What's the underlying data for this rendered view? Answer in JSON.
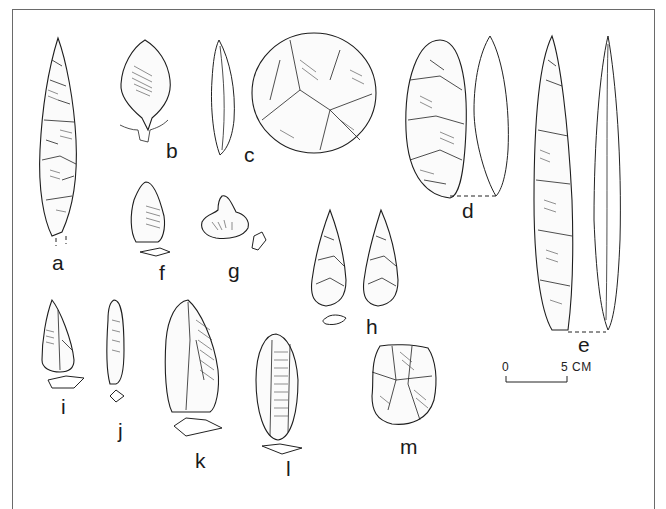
{
  "figure": {
    "type": "archaeological illustration plate",
    "labels": [
      "a",
      "b",
      "c",
      "d",
      "e",
      "f",
      "g",
      "h",
      "i",
      "j",
      "k",
      "l",
      "m"
    ],
    "artifacts": [
      {
        "id": "a",
        "label": "a",
        "description": "long leaf-shaped bifacial point"
      },
      {
        "id": "b",
        "label": "b",
        "description": "tanged/stemmed point with cross-section"
      },
      {
        "id": "c",
        "label": "c",
        "description": "discoid core/scraper with side profile"
      },
      {
        "id": "d",
        "label": "d",
        "description": "oval biface with side profile"
      },
      {
        "id": "e",
        "label": "e",
        "description": "long blade point with side profile"
      },
      {
        "id": "f",
        "label": "f",
        "description": "small flake tool with cross-section"
      },
      {
        "id": "g",
        "label": "g",
        "description": "notched piece with section"
      },
      {
        "id": "h",
        "label": "h",
        "description": "pair of triangular points with cross-section"
      },
      {
        "id": "i",
        "label": "i",
        "description": "small point with cross-section"
      },
      {
        "id": "j",
        "label": "j",
        "description": "narrow blade tool with cross-section"
      },
      {
        "id": "k",
        "label": "k",
        "description": "large flake/blade with cross-section"
      },
      {
        "id": "l",
        "label": "l",
        "description": "blade scraper with cross-section"
      },
      {
        "id": "m",
        "label": "m",
        "description": "core fragment"
      }
    ],
    "scale_bar": {
      "start_label": "0",
      "end_label": "5 CM"
    }
  }
}
